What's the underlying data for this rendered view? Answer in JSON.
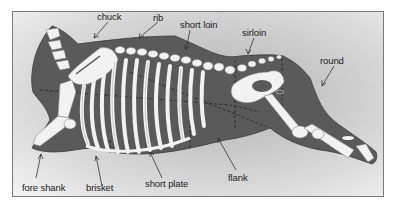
{
  "diagram": {
    "colors": {
      "carcass": "#5a5a5a",
      "bone": "#f2f2f2",
      "bone_outline": "#9a9a9a",
      "frame_border": "#7a7a7a",
      "label_text": "#222222",
      "arrow": "#333333"
    },
    "labels": [
      {
        "id": "chuck",
        "text": "chuck"
      },
      {
        "id": "rib",
        "text": "rib"
      },
      {
        "id": "short_loin",
        "text": "short loin"
      },
      {
        "id": "sirloin",
        "text": "sirloin"
      },
      {
        "id": "round",
        "text": "round"
      },
      {
        "id": "fore_shank",
        "text": "fore shank"
      },
      {
        "id": "brisket",
        "text": "brisket"
      },
      {
        "id": "short_plate",
        "text": "short plate"
      },
      {
        "id": "flank",
        "text": "flank"
      }
    ]
  }
}
